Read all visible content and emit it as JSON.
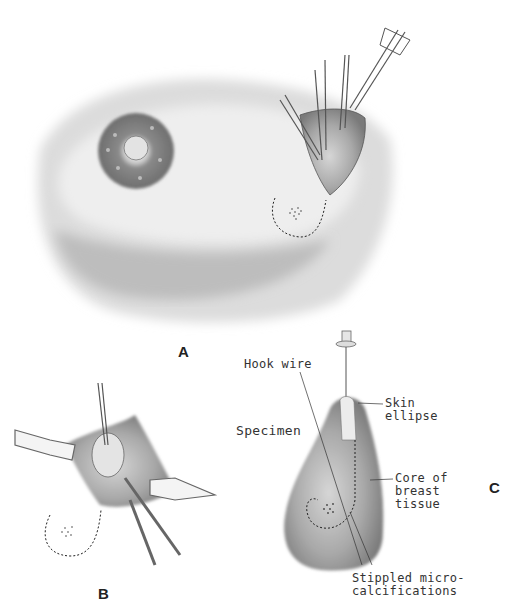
{
  "figure": {
    "panels": [
      {
        "id": "A",
        "label": "A",
        "description": "Breast with nipple-areola and wire-localized excision through incision with retractors and clamps; dotted outline of specimen with stippled microcalcifications"
      },
      {
        "id": "B",
        "label": "B",
        "description": "Close-up of excision field with retractors, hook wire and clamps; dotted outline of specimen with stippled microcalcifications"
      },
      {
        "id": "C",
        "label": "C",
        "description": "Excised specimen with skin ellipse, hook wire and core of breast tissue"
      }
    ],
    "callouts": {
      "hook_wire": "Hook wire",
      "specimen": "Specimen",
      "skin_ellipse_1": "Skin",
      "skin_ellipse_2": "ellipse",
      "core_1": "Core of",
      "core_2": "breast",
      "core_3": "tissue",
      "stippled_1": "Stippled micro-",
      "stippled_2": "calcifications"
    },
    "colors": {
      "background": "#ffffff",
      "skin_shade": "#b8b8b8",
      "tissue": "#9a9a9a",
      "ink": "#333333"
    }
  }
}
